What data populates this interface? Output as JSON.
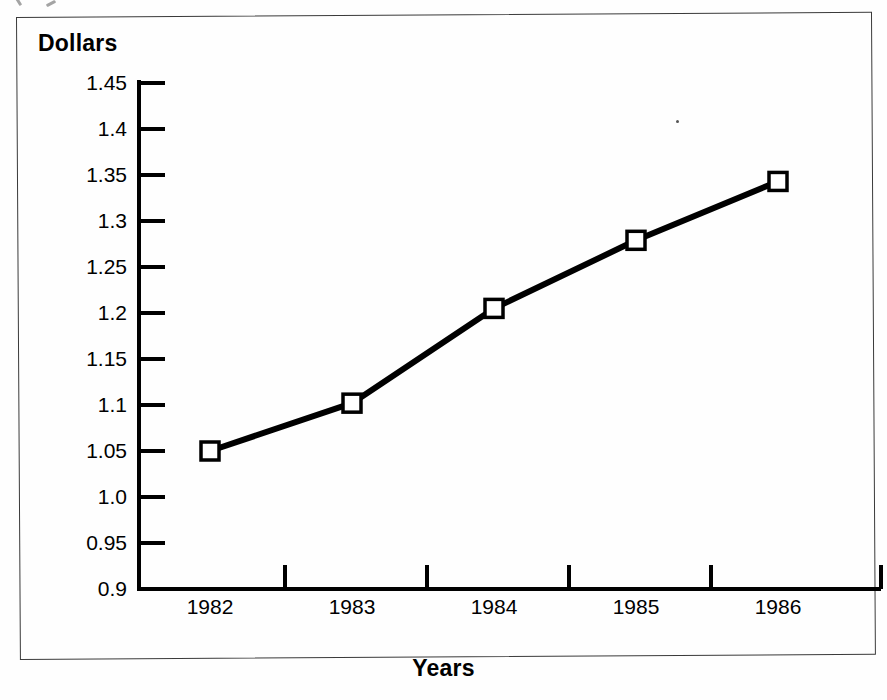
{
  "figure": {
    "frame_visible": true,
    "background_color": "#fefefe",
    "ink_color": "#000000"
  },
  "chart_data": {
    "type": "line",
    "title": "",
    "subtitle": "",
    "xlabel": "Years",
    "ylabel": "Dollars",
    "categories": [
      "1982",
      "1983",
      "1984",
      "1985",
      "1986"
    ],
    "values": [
      1.05,
      1.102,
      1.205,
      1.279,
      1.343
    ],
    "series": [
      {
        "name": "Dollars",
        "values": [
          1.05,
          1.102,
          1.205,
          1.279,
          1.343
        ],
        "line_color": "#000000",
        "line_width_px": 6,
        "marker": "open-square",
        "marker_size_px": 18
      }
    ],
    "ylim": [
      0.9,
      1.45
    ],
    "ytick_labels": [
      "1.45",
      "1.4",
      "1.35",
      "1.3",
      "1.25",
      "1.2",
      "1.15",
      "1.1",
      "1.05",
      "1.0",
      "0.95",
      "0.9"
    ],
    "ytick_values": [
      1.45,
      1.4,
      1.35,
      1.3,
      1.25,
      1.2,
      1.15,
      1.1,
      1.05,
      1.0,
      0.95,
      0.9
    ],
    "ytick_step": 0.05,
    "xtick_labels": [
      "1982",
      "1983",
      "1984",
      "1985",
      "1986"
    ],
    "grid": false,
    "legend": "none",
    "axis_style": "left-and-bottom-spine",
    "tick_direction": "outward-left, inward-up",
    "annotations": []
  },
  "axes": {
    "y_title": "Dollars",
    "x_title": "Years"
  }
}
